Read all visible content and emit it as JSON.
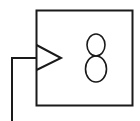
{
  "diagram": {
    "type": "clocked-register-symbol",
    "block": {
      "label": "8",
      "has_clock_input": true
    },
    "wire": {
      "direction": "input-from-below-left"
    },
    "colors": {
      "stroke": "#1a1a1a",
      "background": "#ffffff"
    }
  }
}
